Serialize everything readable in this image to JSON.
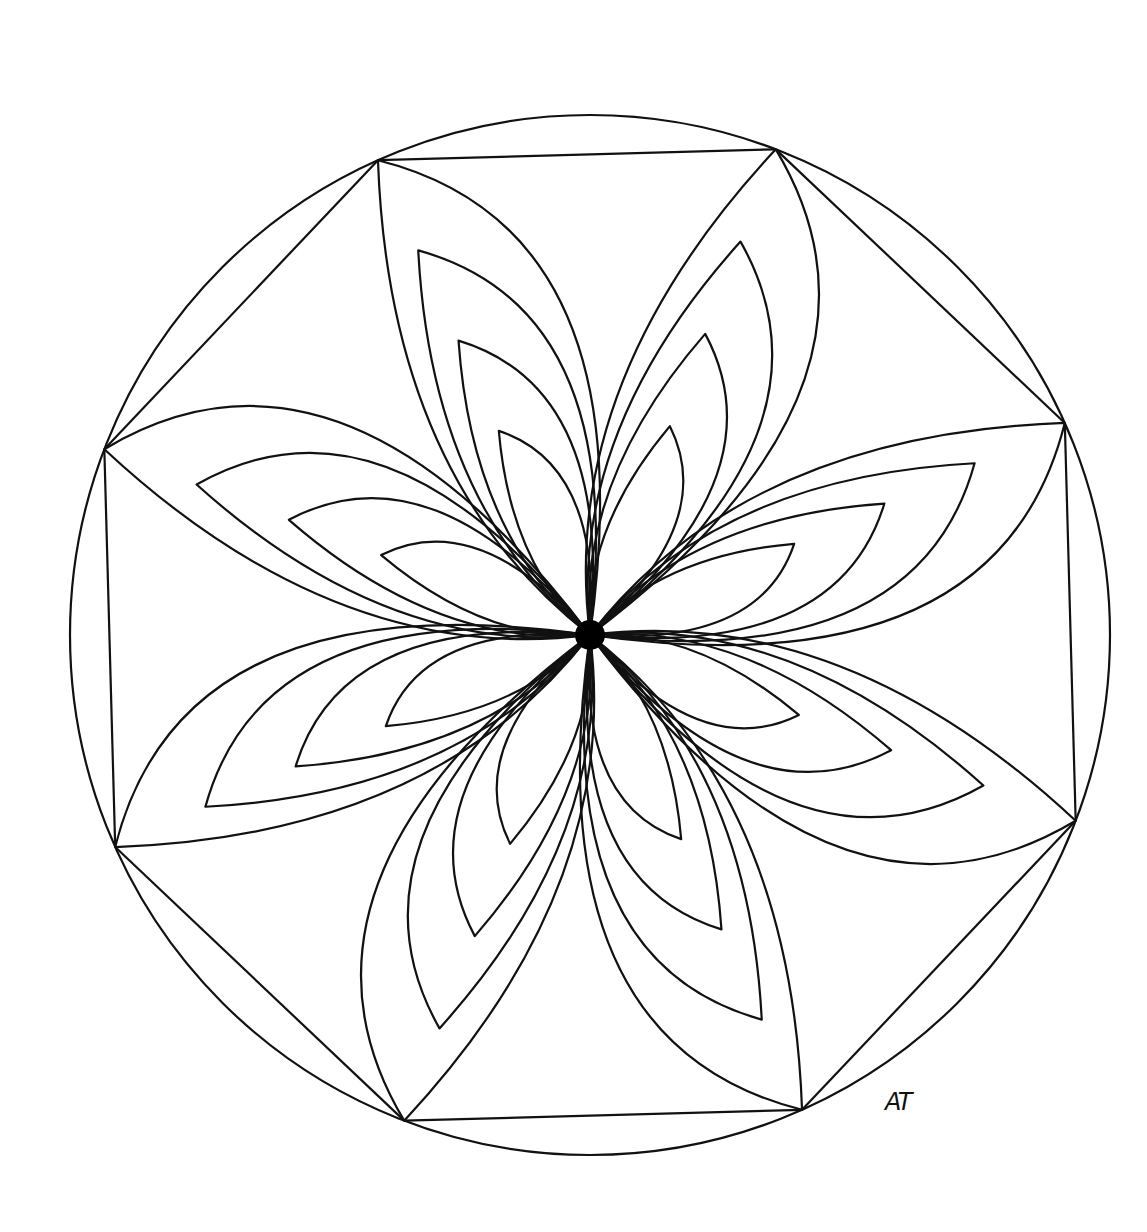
{
  "artwork": {
    "type": "mandala-line-art",
    "background_color": "#ffffff",
    "line_color": "#111111",
    "center": [
      590,
      635
    ],
    "outer_circle_radius": 520,
    "petal_count": 8,
    "nested_petal_layers": 4,
    "octagon_chords": true,
    "center_dot_radius": 15
  },
  "signature": {
    "text": "AT"
  }
}
